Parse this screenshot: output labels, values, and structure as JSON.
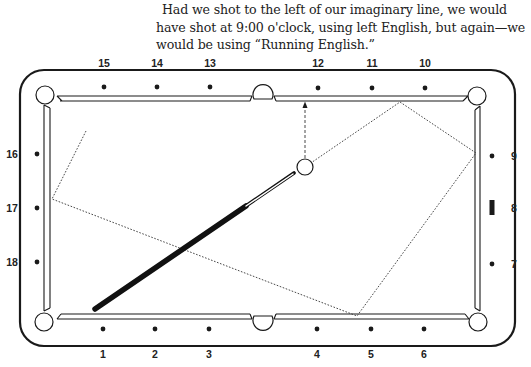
{
  "caption": {
    "text": "Had we shot to the left of our imaginary line, we would have shot at 9:00 o'clock, using left English, but again—we would be using “Running English.”"
  },
  "diagram": {
    "colors": {
      "ink": "#1a1a1a",
      "background": "#ffffff"
    },
    "rail_labels": {
      "top": [
        "15",
        "14",
        "13",
        "12",
        "11",
        "10"
      ],
      "bottom": [
        "1",
        "2",
        "3",
        "4",
        "5",
        "6"
      ],
      "left": [
        "16",
        "17",
        "18"
      ],
      "right": [
        "9",
        "8",
        "7"
      ]
    },
    "icons": {
      "cue_ball": "circle-icon",
      "cue_stick": "cue-stick-icon",
      "aim_marker": "bar-marker-icon"
    },
    "ball_path": "dotted line: cue ball to top rail, right rail, bottom rail, left rail",
    "aim_line": "dashed arrow from cue ball perpendicular to top rail"
  }
}
